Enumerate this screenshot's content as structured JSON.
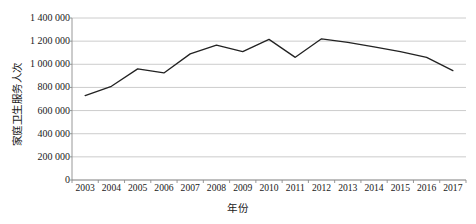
{
  "chart_data": {
    "type": "line",
    "title": "",
    "xlabel": "年份",
    "ylabel": "家庭卫生服务人次",
    "categories": [
      "2003",
      "2004",
      "2005",
      "2006",
      "2007",
      "2008",
      "2009",
      "2010",
      "2011",
      "2012",
      "2013",
      "2014",
      "2015",
      "2016",
      "2017"
    ],
    "values": [
      730000,
      810000,
      960000,
      925000,
      1090000,
      1165000,
      1110000,
      1215000,
      1060000,
      1220000,
      1190000,
      1150000,
      1110000,
      1060000,
      945000
    ],
    "series": [
      {
        "name": "家庭卫生服务人次",
        "values": [
          730000,
          810000,
          960000,
          925000,
          1090000,
          1165000,
          1110000,
          1215000,
          1060000,
          1220000,
          1190000,
          1150000,
          1110000,
          1060000,
          945000
        ],
        "color": "#222222"
      }
    ],
    "ylim": [
      0,
      1400000
    ],
    "yticks": [
      0,
      200000,
      400000,
      600000,
      800000,
      1000000,
      1200000,
      1400000
    ],
    "ytick_labels": [
      "0",
      "200 000",
      "400 000",
      "600 000",
      "800 000",
      "1 000 000",
      "1 200 000",
      "1 400 000"
    ],
    "grid": true,
    "grid_axis": "y",
    "grid_color": "#bfbfbf",
    "legend": false,
    "legend_position": "none",
    "markers": false,
    "line_width": 1.3
  }
}
